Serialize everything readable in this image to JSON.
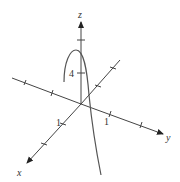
{
  "diagram": {
    "type": "3d-axes-with-curve",
    "axes": {
      "x": {
        "label": "x",
        "tick_label": "1"
      },
      "y": {
        "label": "y",
        "tick_label": "1"
      },
      "z": {
        "label": "z",
        "tick_label": "4"
      }
    },
    "curve": {
      "description": "parabola-shaped space curve opening downward, peak above z=4"
    },
    "colors": {
      "axis": "#444444",
      "curve": "#555555",
      "text": "#333333",
      "background": "#ffffff"
    }
  }
}
